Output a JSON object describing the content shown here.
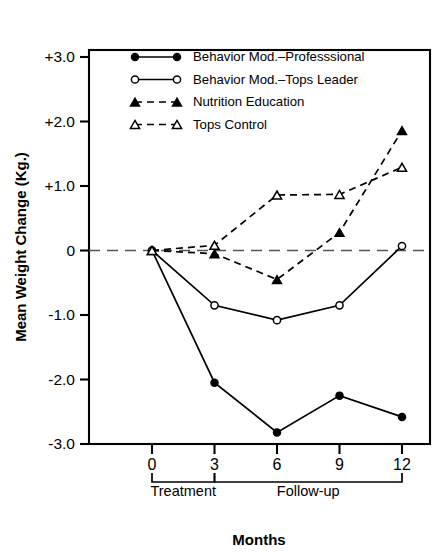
{
  "chart_data": {
    "type": "line",
    "title": "",
    "xlabel": "Months",
    "ylabel": "Mean Weight Change (Kg.)",
    "x": [
      0,
      3,
      6,
      9,
      12
    ],
    "xtick_labels": [
      "0",
      "3",
      "6",
      "9",
      "12"
    ],
    "ytick_labels": [
      "+3.0",
      "+2.0",
      "+1.0",
      "0",
      "-1.0",
      "-2.0",
      "-3.0"
    ],
    "ytick_values": [
      3,
      2,
      1,
      0,
      -1,
      -2,
      -3
    ],
    "xlim": [
      -1.6,
      13.0
    ],
    "ylim": [
      -3,
      3.45
    ],
    "grid": false,
    "zero_reference_line": 0,
    "legend_position": "inside-top-left",
    "series": [
      {
        "name": "Behavior Mod.–Professsional",
        "marker": "filled-circle",
        "linestyle": "solid",
        "color": "#000000",
        "values": [
          0,
          -2.05,
          -2.82,
          -2.25,
          -2.58
        ]
      },
      {
        "name": "Behavior Mod.–Tops Leader",
        "marker": "open-circle",
        "linestyle": "solid",
        "color": "#000000",
        "values": [
          0,
          -0.85,
          -1.08,
          -0.85,
          0.07
        ]
      },
      {
        "name": "Nutrition Education",
        "marker": "filled-triangle",
        "linestyle": "dashed",
        "color": "#000000",
        "values": [
          0,
          -0.05,
          -0.45,
          0.28,
          1.86
        ]
      },
      {
        "name": "Tops Control",
        "marker": "open-triangle",
        "linestyle": "dashed",
        "color": "#000000",
        "values": [
          0,
          0.08,
          0.86,
          0.87,
          1.29
        ]
      }
    ],
    "annotations": [
      {
        "label": "Treatment",
        "x_start": 0,
        "x_end": 3
      },
      {
        "label": "Follow-up",
        "x_start": 3,
        "x_end": 12
      }
    ]
  }
}
